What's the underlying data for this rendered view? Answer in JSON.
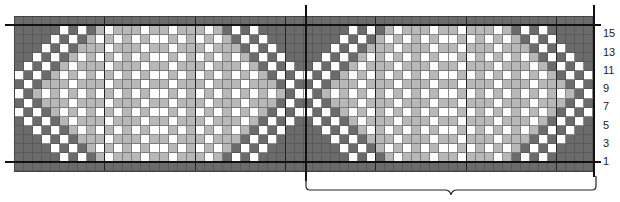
{
  "chart": {
    "type": "knitting-chart",
    "columns": 64,
    "rows": 17,
    "colors": {
      "D": "#6b6b6b",
      "L": "#b8b8b8",
      "W": "#ffffff"
    },
    "legend_note": "D = dark gray, L = light gray, W = white",
    "row_labels": [
      {
        "label": "15",
        "y": 33
      },
      {
        "label": "13",
        "y": 52
      },
      {
        "label": "11",
        "y": 70
      },
      {
        "label": "9",
        "y": 88
      },
      {
        "label": "7",
        "y": 106
      },
      {
        "label": "5",
        "y": 125
      },
      {
        "label": "3",
        "y": 143
      },
      {
        "label": "1",
        "y": 161
      }
    ],
    "repeat_bracket": {
      "from_column": 33,
      "to_column": 64,
      "label": ""
    },
    "grid": [
      "DDDDDDDDDDDDDDDDDDDDDDDDDDDDDDDDDDDDDDDDDDDDDDDDDDDDDDDDDDDDDDDD",
      "DDDDDWDWDLWLLLWLLWLLLWLDWDWDDDDDDDDDDWDWDLWLLLWLLWLLLWLDWDWDDDDD",
      "DDDDWDWDLWLWLWLWWLWLWLWLDWDWDDDDDDDDWDWDLWLWLWLWWLWLWLWLDWDWDDDD",
      "DDDWDWDLLLWLLLWLLWLLLWLLLDWDWDDDDDDWDWDLLLWLLLWLLWLLLWLLLDWDWDDD",
      "DDWDWDLWLWLWLWLWWLWLWLWLWLDWDWDDDDWDWDLWLWLWLWLWWLWLWLWLWLDWDWDD",
      "DWDWDLWLLLWLLLWLLWLLLWLLLWLDWDWDDWDWDLWLLLWLLLWLLWLLLWLLLWLDWDWD",
      "WDWDLWLWLWLWLWLWWLWLWLWLWLWLDWDWWDWDLWLWLWLWLWLWWLWLWLWLWLWLDWDW",
      "DWDLLLWLLLWLLLWLLWLLLWLLLWLLLDWDDWDLLLWLLLWLLLWLLWLLLWLLLWLLLDWD",
      "WDLWLWLWLWLWLWLWWLWLWLWLWLWLWLDWWDLWLWLWLWLWLWLWWLWLWLWLWLWLWLDW",
      "DWDLLLWLLLWLLLWLLWLLLWLLLWLLLDWDDWDLLLWLLLWLLLWLLWLLLWLLLWLLLDWD",
      "WDWDLWLWLWLWLWLWWLWLWLWLWLWLDWDWWDWDLWLWLWLWLWLWWLWLWLWLWLWLDWDW",
      "DWDWDLWLLLWLLLWLLWLLLWLLLWLDWDWDDWDWDLWLLLWLLLWLLWLLLWLLLWLDWDWD",
      "DDWDWDLWLWLWLWLWWLWLWLWLWLDWDWDDDDWDWDLWLWLWLWLWWLWLWLWLWLDWDWDD",
      "DDDWDWDLLLWLLLWLLWLLLWLLLDWDWDDDDDDWDWDLLLWLLLWLLWLLLWLLLDWDWDDD",
      "DDDDWDWDLWLWLWLWWLWLWLWLDWDWDDDDDDDDWDWDLWLWLWLWWLWLWLWLDWDWDDDD",
      "DDDDDWDWDLWLLLWLLWLLLWLDWDWDDDDDDDDDDWDWDLWLLLWLLWLLLWLDWDWDDDDD",
      "DDDDDDDDDDDDDDDDDDDDDDDDDDDDDDDDDDDDDDDDDDDDDDDDDDDDDDDDDDDDDDDD"
    ]
  }
}
